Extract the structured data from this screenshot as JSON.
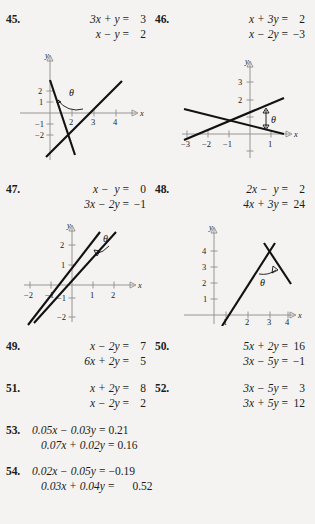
{
  "page": {
    "background_color": "#f4f3f1",
    "text_color": "#1b1b1b",
    "line_color": "#111111",
    "axis_color": "#8d8d8d"
  },
  "problems": [
    {
      "number": "45.",
      "equations": [
        {
          "lhs": "3x + y",
          "rel": "=",
          "rhs": "3"
        },
        {
          "lhs": "x − y",
          "rel": "=",
          "rhs": "2"
        }
      ]
    },
    {
      "number": "46.",
      "equations": [
        {
          "lhs": "x + 3y",
          "rel": "=",
          "rhs": "2"
        },
        {
          "lhs": "x − 2y",
          "rel": "=",
          "rhs": "−3"
        }
      ]
    },
    {
      "number": "47.",
      "equations": [
        {
          "lhs": "x −  y",
          "rel": "=",
          "rhs": "0"
        },
        {
          "lhs": "3x − 2y",
          "rel": "=",
          "rhs": "−1"
        }
      ]
    },
    {
      "number": "48.",
      "equations": [
        {
          "lhs": "2x −  y",
          "rel": "=",
          "rhs": "2"
        },
        {
          "lhs": "4x + 3y",
          "rel": "=",
          "rhs": "24"
        }
      ]
    },
    {
      "number": "49.",
      "equations": [
        {
          "lhs": "x − 2y",
          "rel": "=",
          "rhs": "7"
        },
        {
          "lhs": "6x + 2y",
          "rel": "=",
          "rhs": "5"
        }
      ]
    },
    {
      "number": "50.",
      "equations": [
        {
          "lhs": "5x + 2y",
          "rel": "=",
          "rhs": "16"
        },
        {
          "lhs": "3x − 5y",
          "rel": "=",
          "rhs": "−1"
        }
      ]
    },
    {
      "number": "51.",
      "equations": [
        {
          "lhs": "x + 2y",
          "rel": "=",
          "rhs": "8"
        },
        {
          "lhs": "x − 2y",
          "rel": "=",
          "rhs": "2"
        }
      ]
    },
    {
      "number": "52.",
      "equations": [
        {
          "lhs": "3x − 5y",
          "rel": "=",
          "rhs": "3"
        },
        {
          "lhs": "3x + 5y",
          "rel": "=",
          "rhs": "12"
        }
      ]
    },
    {
      "number": "53.",
      "equations": [
        {
          "lhs": "0.05x − 0.03y",
          "rel": "=",
          "rhs": "0.21"
        },
        {
          "lhs": "0.07x + 0.02y",
          "rel": "=",
          "rhs": "0.16"
        }
      ]
    },
    {
      "number": "54.",
      "equations": [
        {
          "lhs": "0.02x − 0.05y",
          "rel": "=",
          "rhs": "−0.19"
        },
        {
          "lhs": "0.03x + 0.04y",
          "rel": "=",
          "rhs": "0.52"
        }
      ]
    }
  ],
  "graphs": [
    {
      "id": "graph-45",
      "for_problem": "45",
      "x_axis_label": "x",
      "y_axis_label": "y",
      "x_ticks": [
        "2",
        "3",
        "4"
      ],
      "y_ticks": [
        "2",
        "1",
        "−1",
        "−2"
      ],
      "angle_label": "θ",
      "lines": [
        {
          "equation": "3x + y = 3",
          "slope": -3,
          "intercept": 3
        },
        {
          "equation": "x − y = 2",
          "slope": 1,
          "intercept": -2
        }
      ]
    },
    {
      "id": "graph-46",
      "for_problem": "46",
      "x_axis_label": "x",
      "y_axis_label": "y",
      "x_ticks": [
        "−3",
        "−2",
        "−1",
        "1"
      ],
      "y_ticks": [
        "3",
        "2"
      ],
      "angle_label": "θ",
      "lines": [
        {
          "equation": "x + 3y = 2",
          "slope": -0.3333,
          "intercept": 0.6667
        },
        {
          "equation": "x − 2y = −3",
          "slope": 0.5,
          "intercept": 1.5
        }
      ]
    },
    {
      "id": "graph-47",
      "for_problem": "47",
      "x_axis_label": "x",
      "y_axis_label": "y",
      "x_ticks": [
        "−2",
        "−1",
        "1",
        "2"
      ],
      "y_ticks": [
        "2",
        "1",
        "−1",
        "−2"
      ],
      "angle_label": "θ",
      "lines": [
        {
          "equation": "x − y = 0",
          "slope": 1,
          "intercept": 0
        },
        {
          "equation": "3x − 2y = −1",
          "slope": 1.5,
          "intercept": 0.5
        }
      ]
    },
    {
      "id": "graph-48",
      "for_problem": "48",
      "x_axis_label": "x",
      "y_axis_label": "y",
      "x_ticks": [
        "1",
        "2",
        "3",
        "4"
      ],
      "y_ticks": [
        "4",
        "3",
        "2",
        "1"
      ],
      "angle_label": "θ",
      "lines": [
        {
          "equation": "2x − y = 2",
          "slope": 2,
          "intercept": -2
        },
        {
          "equation": "4x + 3y = 24",
          "slope": -1.3333,
          "intercept": 8
        }
      ]
    }
  ]
}
